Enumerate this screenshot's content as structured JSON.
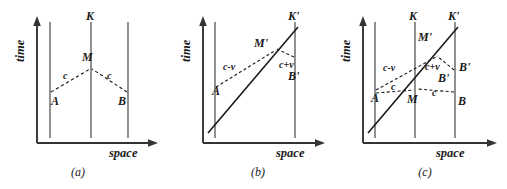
{
  "figure": {
    "type": "spacetime-diagram",
    "panel_count": 3,
    "colors": {
      "background": "#ffffff",
      "ink": "#333333",
      "label": "#1a1a1a"
    },
    "axes": {
      "time_label": "time",
      "space_label": "space"
    }
  },
  "panels": [
    {
      "caption": "(a)",
      "origin": {
        "x": 37,
        "y": 143
      },
      "axis_time_top": 18,
      "axis_space_right": 158,
      "worldlines": [
        {
          "name": "left-worldline",
          "x": 50,
          "top": 22,
          "bottom": 138,
          "label": ""
        },
        {
          "name": "center-worldline",
          "x": 91,
          "top": 22,
          "bottom": 138,
          "label": "K"
        },
        {
          "name": "right-worldline",
          "x": 128,
          "top": 22,
          "bottom": 138,
          "label": ""
        }
      ],
      "labels": {
        "K": "K",
        "M": "M",
        "A": "A",
        "B": "B",
        "c_left": "c",
        "c_right": "c"
      },
      "events": {
        "A": {
          "x": 50,
          "y": 93
        },
        "B": {
          "x": 128,
          "y": 93
        },
        "M": {
          "x": 91,
          "y": 70
        }
      },
      "signals": [
        {
          "name": "light-ray-A-to-M",
          "from": "A",
          "to": "M",
          "speed_label": "c"
        },
        {
          "name": "light-ray-B-to-M",
          "from": "B",
          "to": "M",
          "speed_label": "c"
        }
      ]
    },
    {
      "caption": "(b)",
      "origin": {
        "x": 203,
        "y": 143
      },
      "axis_time_top": 18,
      "axis_space_right": 325,
      "worldlines": [
        {
          "name": "left-worldline",
          "x": 215,
          "top": 22,
          "bottom": 138,
          "label": ""
        },
        {
          "name": "right-worldline",
          "x": 295,
          "top": 22,
          "bottom": 138,
          "label": ""
        }
      ],
      "moving_frame": {
        "name": "K-prime-worldline",
        "label": "K'",
        "from": {
          "x": 208,
          "y": 133
        },
        "to": {
          "x": 298,
          "y": 27
        }
      },
      "labels": {
        "Kprime": "K'",
        "Mprime": "M'",
        "A": "A",
        "Bprime": "B'",
        "c_minus_v": "c-v",
        "c_plus_v": "c+v"
      },
      "events": {
        "A": {
          "x": 215,
          "y": 88
        },
        "Mprime": {
          "x": 270,
          "y": 55
        },
        "Bprime": {
          "x": 295,
          "y": 58
        }
      },
      "signals": [
        {
          "name": "light-ray-A-to-Mprime",
          "speed_label": "c-v"
        },
        {
          "name": "light-ray-Bprime-to-Mprime",
          "speed_label": "c+v"
        }
      ]
    },
    {
      "caption": "(c)",
      "origin": {
        "x": 363,
        "y": 143
      },
      "axis_time_top": 18,
      "axis_space_right": 497,
      "worldlines": [
        {
          "name": "left-worldline",
          "x": 375,
          "top": 22,
          "bottom": 138,
          "label": ""
        },
        {
          "name": "center-worldline",
          "x": 415,
          "top": 22,
          "bottom": 138,
          "label": "K"
        },
        {
          "name": "right-worldline",
          "x": 455,
          "top": 22,
          "bottom": 138,
          "label": ""
        }
      ],
      "moving_frame": {
        "name": "K-prime-worldline",
        "label": "K'",
        "from": {
          "x": 368,
          "y": 133
        },
        "to": {
          "x": 458,
          "y": 27
        }
      },
      "labels": {
        "K": "K",
        "Kprime": "K'",
        "Mprime": "M'",
        "M": "M",
        "A": "A",
        "B": "B",
        "Bprime_inner": "B'",
        "Bprime_outer": "B'",
        "c_minus_v": "c-v",
        "c_plus_v": "c+v",
        "c_left": "c",
        "c_right": "c"
      },
      "events": {
        "A": {
          "x": 375,
          "y": 91
        },
        "M": {
          "x": 415,
          "y": 91
        },
        "B": {
          "x": 455,
          "y": 91
        },
        "Mprime": {
          "x": 432,
          "y": 62
        },
        "Bprime": {
          "x": 455,
          "y": 72
        }
      },
      "signals": [
        {
          "name": "light-ray-A-to-Mprime",
          "speed_label": "c-v"
        },
        {
          "name": "light-ray-A-to-M",
          "speed_label": "c"
        },
        {
          "name": "light-ray-Bprime-to-Mprime",
          "speed_label": "c+v"
        },
        {
          "name": "light-ray-B-to-M",
          "speed_label": "c"
        }
      ]
    }
  ],
  "captions": {
    "a": "(a)",
    "b": "(b)",
    "c": "(c)"
  }
}
